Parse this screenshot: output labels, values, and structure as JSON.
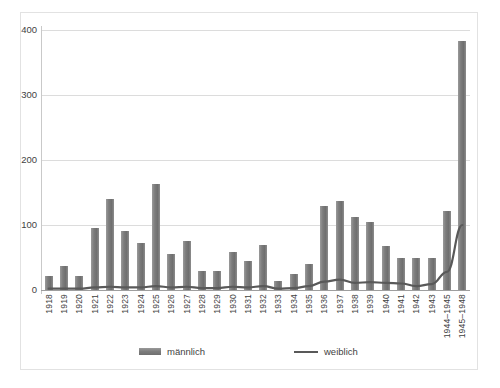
{
  "chart_data": {
    "type": "bar",
    "title": "",
    "subtitle": "",
    "xlabel": "",
    "ylabel": "",
    "ylim": [
      0,
      400
    ],
    "yticks": [
      0,
      100,
      200,
      300,
      400
    ],
    "grid": true,
    "legend_position": "bottom",
    "categories": [
      "1918",
      "1919",
      "1920",
      "1921",
      "1922",
      "1923",
      "1924",
      "1925",
      "1926",
      "1927",
      "1928",
      "1929",
      "1930",
      "1931",
      "1932",
      "1933",
      "1934",
      "1935",
      "1936",
      "1937",
      "1938",
      "1939",
      "1940",
      "1941",
      "1942",
      "1943",
      "1944–1945",
      "1945–1948"
    ],
    "series": [
      {
        "name": "männlich",
        "type": "bar",
        "color": "#7c7c7c",
        "values": [
          22,
          37,
          22,
          95,
          140,
          91,
          73,
          163,
          55,
          76,
          30,
          30,
          58,
          45,
          70,
          14,
          24,
          40,
          130,
          137,
          112,
          104,
          68,
          49,
          49,
          50,
          122,
          383
        ]
      },
      {
        "name": "weiblich",
        "type": "line",
        "color": "#595959",
        "values": [
          2,
          2,
          2,
          4,
          5,
          4,
          4,
          6,
          4,
          5,
          3,
          3,
          5,
          4,
          6,
          2,
          3,
          6,
          13,
          16,
          11,
          12,
          11,
          10,
          6,
          9,
          28,
          100
        ]
      }
    ]
  },
  "axis": {
    "y_tick_labels": [
      "400",
      "300",
      "200",
      "100",
      "0"
    ]
  },
  "legend": {
    "items": [
      {
        "label": "männlich",
        "swatch": "bar-swatch"
      },
      {
        "label": "weiblich",
        "swatch": "line-swatch"
      }
    ]
  }
}
